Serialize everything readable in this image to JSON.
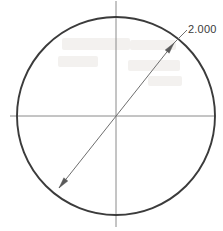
{
  "drawing": {
    "type": "engineering-dimension-sketch",
    "background_color": "#ffffff",
    "width": 223,
    "height": 231,
    "circle": {
      "name": "dimensioned-circle",
      "center_x": 116,
      "center_y": 116,
      "radius": 99,
      "stroke_color": "#3b3b3b",
      "stroke_width": 1.9
    },
    "centerlines": {
      "stroke_color": "#8a8a8a",
      "stroke_width": 1.0,
      "horizontal": {
        "name": "horizontal-centerline",
        "x1": 10,
        "y1": 116,
        "x2": 214,
        "y2": 116
      },
      "vertical": {
        "name": "vertical-centerline",
        "x1": 116,
        "y1": 1,
        "x2": 116,
        "y2": 227
      }
    },
    "dimension": {
      "name": "diameter-dimension-line",
      "value_label": "2.000",
      "stroke_color": "#6e6e6e",
      "stroke_width": 1.0,
      "line": {
        "x1": 59,
        "y1": 188,
        "x2": 174,
        "y2": 43
      },
      "arrow_start": {
        "name": "arrowhead-lower-left",
        "x": 59,
        "y": 188
      },
      "arrow_end": {
        "name": "arrowhead-upper-right",
        "x": 174,
        "y": 43
      },
      "leader": {
        "name": "leader-line",
        "x1": 174,
        "y1": 43,
        "x2": 187,
        "y2": 30
      },
      "text_x": 188,
      "text_y": 33
    }
  }
}
